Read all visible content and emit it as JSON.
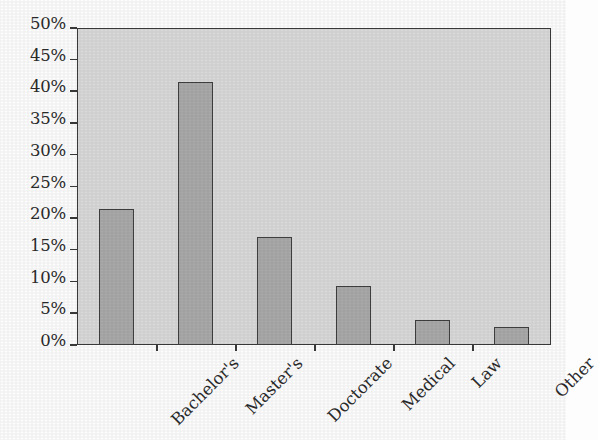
{
  "chart_data": {
    "type": "bar",
    "title": "",
    "subtitle": "",
    "xlabel": "",
    "ylabel": "",
    "categories": [
      "Bachelor's",
      "Master's",
      "Doctorate",
      "Medical",
      "Law",
      "Other"
    ],
    "values": [
      21.5,
      41.5,
      17.0,
      9.3,
      4.0,
      2.9
    ],
    "value_unit": "%",
    "ylim": [
      0,
      50
    ],
    "ytick_labels": [
      "0%",
      "5%",
      "10%",
      "15%",
      "20%",
      "25%",
      "30%",
      "35%",
      "40%",
      "45%",
      "50%"
    ],
    "ytick_values": [
      0,
      5,
      10,
      15,
      20,
      25,
      30,
      35,
      40,
      45,
      50
    ],
    "grid": false,
    "legend": "none",
    "xtick_label_rotation": -45,
    "bar_count": 6
  },
  "style": {
    "plot_background": "#d9d9d9",
    "page_background": "#fdfdfd",
    "bar_fill": "#a9a9a9",
    "bar_border": "#3f3f3f",
    "axis_color": "#3a3a3a",
    "text_color": "#2b2b2b"
  }
}
